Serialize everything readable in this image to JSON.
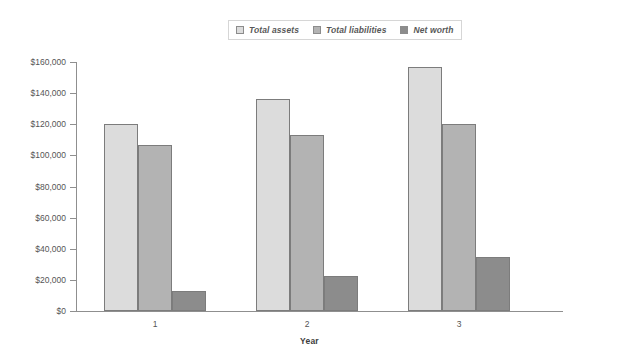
{
  "chart_data": {
    "type": "bar",
    "title": "",
    "xlabel": "Year",
    "ylabel": "",
    "categories": [
      "1",
      "2",
      "3"
    ],
    "series": [
      {
        "name": "Total assets",
        "values": [
          120000,
          136000,
          157000
        ],
        "color": "#dcdcdc"
      },
      {
        "name": "Total liabilities",
        "values": [
          106500,
          113000,
          120000
        ],
        "color": "#b3b3b3"
      },
      {
        "name": "Net worth",
        "values": [
          13000,
          22500,
          35000
        ],
        "color": "#8c8c8c"
      }
    ],
    "ylim": [
      0,
      160000
    ],
    "ytick_step": 20000,
    "ytick_labels": [
      "$0",
      "$20,000",
      "$40,000",
      "$60,000",
      "$80,000",
      "$100,000",
      "$120,000",
      "$140,000",
      "$160,000"
    ],
    "grid": false,
    "legend_position": "top-center"
  },
  "legend": {
    "items": [
      {
        "label": "Total assets"
      },
      {
        "label": "Total liabilities"
      },
      {
        "label": "Net worth"
      }
    ]
  },
  "axes": {
    "x_title": "Year",
    "x_categories": [
      "1",
      "2",
      "3"
    ]
  }
}
